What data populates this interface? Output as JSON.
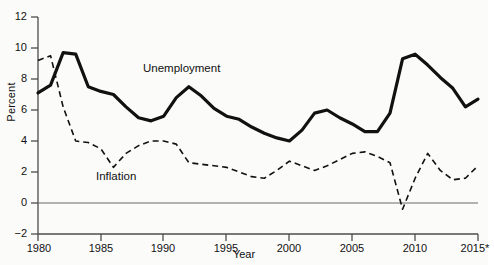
{
  "chart_data": {
    "type": "line",
    "title": "",
    "xlabel": "Year",
    "ylabel": "Percent",
    "xlim": [
      1980,
      2015
    ],
    "ylim": [
      -2,
      12
    ],
    "grid": false,
    "legend_position": "inline-annotations",
    "x": [
      1980,
      1981,
      1982,
      1983,
      1984,
      1985,
      1986,
      1987,
      1988,
      1989,
      1990,
      1991,
      1992,
      1993,
      1994,
      1995,
      1996,
      1997,
      1998,
      1999,
      2000,
      2001,
      2002,
      2003,
      2004,
      2005,
      2006,
      2007,
      2008,
      2009,
      2010,
      2011,
      2012,
      2013,
      2014,
      2015
    ],
    "xticks": [
      1980,
      1985,
      1990,
      1995,
      2000,
      2005,
      2010,
      2015
    ],
    "xticklabels": [
      "1980",
      "1985",
      "1990",
      "1995",
      "2000",
      "2005",
      "2010",
      "2015*"
    ],
    "yticks": [
      -2,
      0,
      2,
      4,
      6,
      8,
      10,
      12
    ],
    "yticklabels": [
      "−2",
      "0",
      "2",
      "4",
      "6",
      "8",
      "10",
      "12"
    ],
    "zero_line": 0,
    "series": [
      {
        "name": "Unemployment",
        "style": "solid",
        "color": "#111111",
        "linewidth": 3.2,
        "values": [
          7.1,
          7.6,
          9.7,
          9.6,
          7.5,
          7.2,
          7.0,
          6.2,
          5.5,
          5.3,
          5.6,
          6.8,
          7.5,
          6.9,
          6.1,
          5.6,
          5.4,
          4.9,
          4.5,
          4.2,
          4.0,
          4.7,
          5.8,
          6.0,
          5.5,
          5.1,
          4.6,
          4.6,
          5.8,
          9.3,
          9.6,
          8.9,
          8.1,
          7.4,
          6.2,
          6.7
        ]
      },
      {
        "name": "Inflation",
        "style": "dashed",
        "color": "#111111",
        "linewidth": 1.6,
        "values": [
          9.2,
          9.5,
          6.2,
          4.0,
          3.9,
          3.5,
          2.3,
          3.2,
          3.7,
          4.0,
          4.0,
          3.8,
          2.6,
          2.5,
          2.4,
          2.3,
          2.0,
          1.7,
          1.6,
          2.1,
          2.7,
          2.4,
          2.1,
          2.4,
          2.8,
          3.2,
          3.3,
          3.0,
          2.6,
          -0.4,
          1.6,
          3.2,
          2.1,
          1.5,
          1.6,
          2.4
        ]
      }
    ],
    "annotations": [
      {
        "text": "Unemployment",
        "series": "Unemployment"
      },
      {
        "text": "Inflation",
        "series": "Inflation"
      }
    ]
  },
  "axes": {
    "y_title": "Percent",
    "x_title": "Year",
    "y_tick_labels": [
      "12",
      "10",
      "8",
      "6",
      "4",
      "2",
      "0",
      "−2"
    ],
    "x_tick_labels": [
      "1980",
      "1985",
      "1990",
      "1995",
      "2000",
      "2005",
      "2010",
      "2015*"
    ]
  },
  "annotations": {
    "unemployment_label": "Unemployment",
    "inflation_label": "Inflation"
  },
  "colors": {
    "line": "#111111",
    "axis": "#555555",
    "background": "#fbfbfa"
  }
}
